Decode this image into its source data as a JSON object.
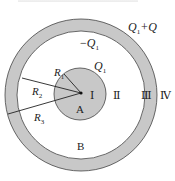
{
  "figure": {
    "type": "concentric-spheres-cross-section",
    "colors": {
      "conductor_fill": "#c8c8c8",
      "stroke": "#444444",
      "background": "#ffffff"
    }
  },
  "labels": {
    "outer_charge": {
      "sym": "Q",
      "sub": "1",
      "rest": "+Q"
    },
    "inner_surface_charge": {
      "sign": "−",
      "sym": "Q",
      "sub": "1"
    },
    "core_charge": {
      "sym": "Q",
      "sub": "1"
    },
    "r1": {
      "sym": "R",
      "sub": "1"
    },
    "r2": {
      "sym": "R",
      "sub": "2"
    },
    "r3": {
      "sym": "R",
      "sub": "3"
    },
    "core_name": "A",
    "shell_name": "B",
    "regions": [
      "Ⅰ",
      "Ⅱ",
      "Ⅲ",
      "Ⅳ"
    ]
  }
}
